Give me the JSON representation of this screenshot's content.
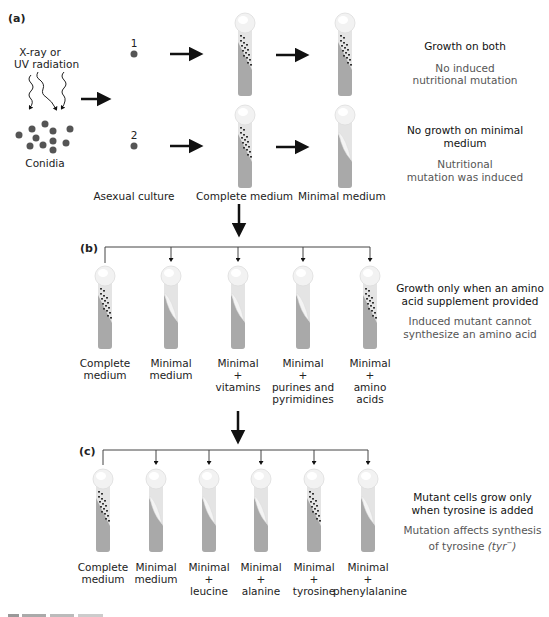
{
  "panel_a": {
    "label": "(a)",
    "radiation_label": [
      "X-ray or",
      "UV radiation"
    ],
    "conidia_label": "Conidia",
    "cultures": [
      {
        "number": "1",
        "complete_medium": "growth",
        "minimal_medium": "growth"
      },
      {
        "number": "2",
        "complete_medium": "growth",
        "minimal_medium": "no growth"
      }
    ],
    "column_labels": {
      "asexual": "Asexual culture",
      "complete": "Complete medium",
      "minimal": "Minimal medium"
    },
    "results": [
      {
        "headline": "Growth on both",
        "explanation": [
          "No induced",
          "nutritional mutation"
        ]
      },
      {
        "headline": [
          "No growth on minimal",
          "medium"
        ],
        "explanation": [
          "Nutritional",
          "mutation was induced"
        ]
      }
    ]
  },
  "panel_b": {
    "label": "(b)",
    "tubes": [
      {
        "label": [
          "Complete",
          "medium"
        ],
        "growth": true
      },
      {
        "label": [
          "Minimal",
          "medium"
        ],
        "growth": false
      },
      {
        "label": [
          "Minimal",
          "+",
          "vitamins"
        ],
        "growth": false
      },
      {
        "label": [
          "Minimal",
          "+",
          "purines and",
          "pyrimidines"
        ],
        "growth": false
      },
      {
        "label": [
          "Minimal",
          "+",
          "amino",
          "acids"
        ],
        "growth": true
      }
    ],
    "result": {
      "headline": [
        "Growth only when an amino",
        "acid supplement provided"
      ],
      "explanation": [
        "Induced mutant cannot",
        "synthesize an amino acid"
      ]
    }
  },
  "panel_c": {
    "label": "(c)",
    "tubes": [
      {
        "label": [
          "Complete",
          "medium"
        ],
        "growth": true
      },
      {
        "label": [
          "Minimal",
          "medium"
        ],
        "growth": false
      },
      {
        "label": [
          "Minimal",
          "+",
          "leucine"
        ],
        "growth": false
      },
      {
        "label": [
          "Minimal",
          "+",
          "alanine"
        ],
        "growth": false
      },
      {
        "label": [
          "Minimal",
          "+",
          "tyrosine"
        ],
        "growth": true
      },
      {
        "label": [
          "Minimal",
          "+",
          "phenylalanine"
        ],
        "growth": false
      }
    ],
    "result": {
      "headline": [
        "Mutant cells grow only",
        "when tyrosine is added"
      ],
      "explanation_line1": "Mutation affects synthesis",
      "explanation_line2_prefix": "of tyrosine ",
      "explanation_line2_italic": "(tyr",
      "explanation_line2_sup": "−",
      "explanation_line2_close": ")"
    }
  },
  "colors": {
    "agar": "#a9a9a9",
    "tube_glass": "#e4e4e4",
    "cap": "#f2f2f2",
    "colony": "#333333",
    "arrow": "#111111",
    "text_primary": "#111111",
    "text_secondary": "#555555"
  }
}
